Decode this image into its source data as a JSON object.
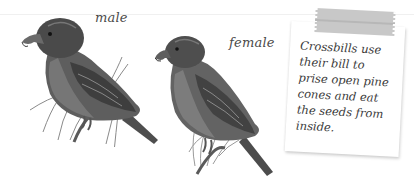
{
  "illustration": {
    "subject": "Crossbills",
    "style": "grayscale pencil drawing",
    "labels": {
      "male": "male",
      "female": "female"
    },
    "birds": [
      {
        "id": "male",
        "label": "male",
        "perch": "pine twig"
      },
      {
        "id": "female",
        "label": "female",
        "perch": "pine twig"
      }
    ]
  },
  "note": {
    "text": "Crossbills use\ntheir bill to\nprise open pine\ncones and eat\nthe seeds from\ninside.",
    "tape_color": "#c6c6c6",
    "paper_color": "#ffffff"
  },
  "colors": {
    "background": "#ffffff",
    "bird_dark": "#3c3c3c",
    "bird_mid": "#6e6e6e",
    "bird_light": "#9a9a9a",
    "text": "#3a3a3a"
  }
}
